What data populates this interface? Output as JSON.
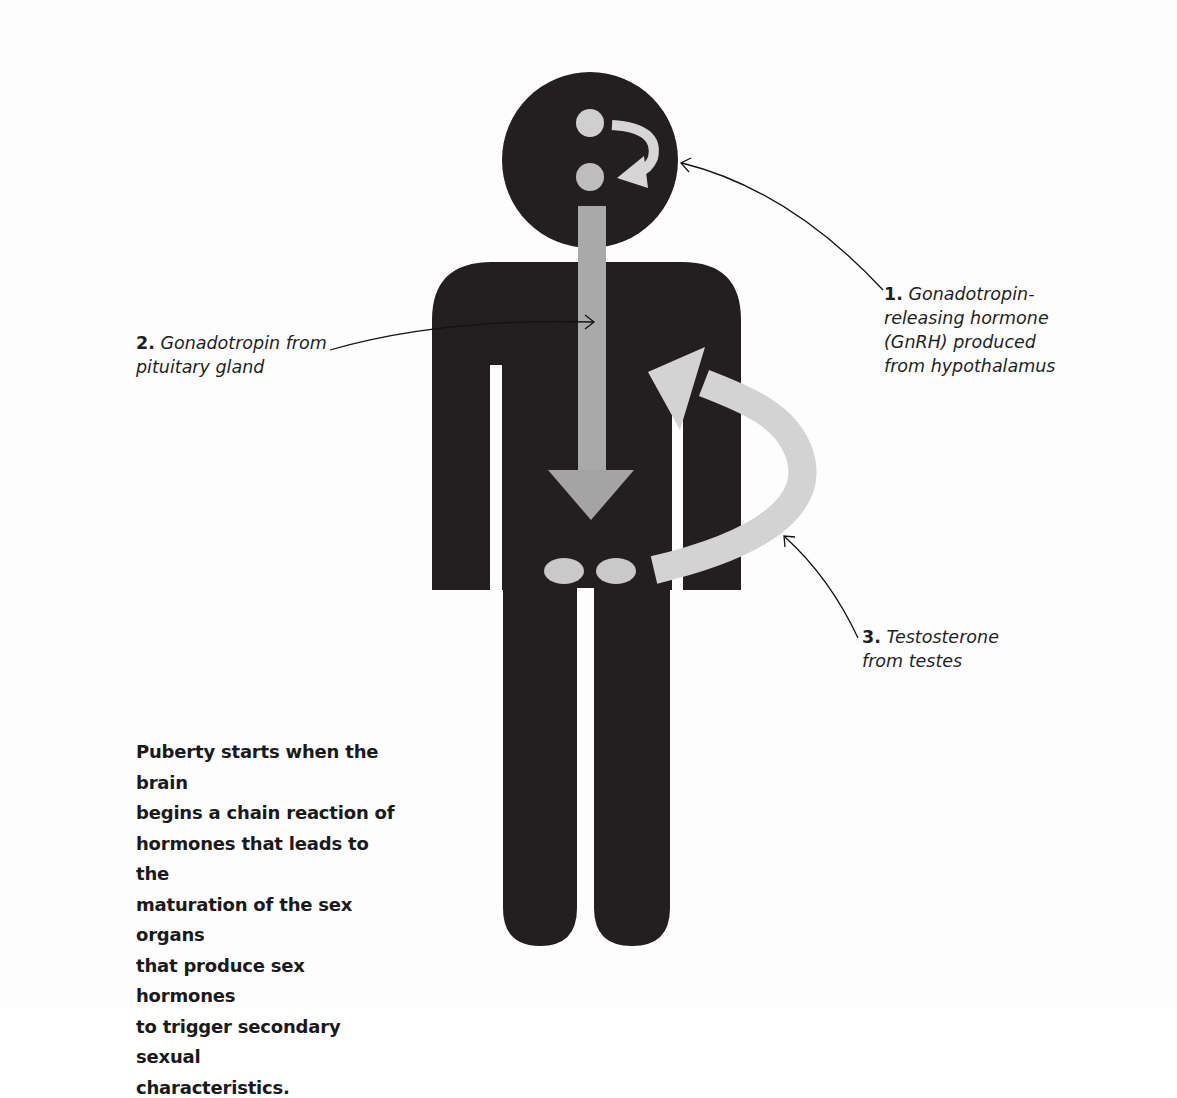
{
  "figure": {
    "colors": {
      "silhouette": "#231f20",
      "hormone_arrow": "#a8a8a8",
      "testosterone_arrow": "#d2d2d2",
      "gland": "#c8c8c8",
      "background": "#fdfdfd",
      "leader_line": "#111111"
    }
  },
  "labels": {
    "l1": {
      "num": "1.",
      "text_line1": "Gonadotropin-",
      "text_line2": "releasing hormone",
      "text_line3": "(GnRH) produced",
      "text_line4": "from hypothalamus"
    },
    "l2": {
      "num": "2.",
      "text_line1": "Gonadotropin from",
      "text_line2": "pituitary gland"
    },
    "l3": {
      "num": "3.",
      "text_line1": "Testosterone",
      "text_line2": "from testes"
    }
  },
  "caption": {
    "lines": [
      "Puberty starts when the brain",
      "begins a chain reaction of",
      "hormones that leads to the",
      "maturation of the sex organs",
      "that produce sex hormones",
      "to trigger secondary sexual",
      "characteristics."
    ]
  }
}
